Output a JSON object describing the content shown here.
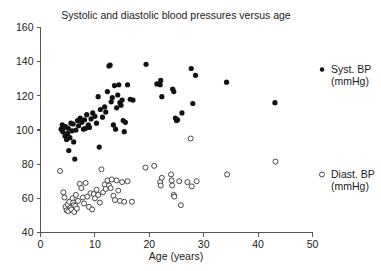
{
  "chart_data": {
    "type": "scatter",
    "title": "Systolic and diastolic blood pressures versus age",
    "xlabel": "Age (years)",
    "ylabel": "",
    "xlim": [
      0,
      50
    ],
    "ylim": [
      40,
      160
    ],
    "xticks": [
      0,
      10,
      20,
      30,
      40,
      50
    ],
    "yticks": [
      40,
      60,
      80,
      100,
      120,
      140,
      160
    ],
    "xtick_labels": [
      "0",
      "10",
      "20",
      "30",
      "40",
      "50"
    ],
    "ytick_labels": [
      "40",
      "60",
      "80",
      "100",
      "120",
      "140",
      "160"
    ],
    "grid": false,
    "legend_position": "right",
    "series": [
      {
        "name": "Syst. BP",
        "unit": "(mmHg)",
        "marker": "filled-circle",
        "color": "#111111",
        "points": [
          [
            3.8,
            100.5
          ],
          [
            4.0,
            103.0
          ],
          [
            4.1,
            99.0
          ],
          [
            4.3,
            101.5
          ],
          [
            4.5,
            96.5
          ],
          [
            4.6,
            102.0
          ],
          [
            4.8,
            94.5
          ],
          [
            5.0,
            98.0
          ],
          [
            5.1,
            101.0
          ],
          [
            5.2,
            88.0
          ],
          [
            5.4,
            95.5
          ],
          [
            5.6,
            104.0
          ],
          [
            5.8,
            99.5
          ],
          [
            6.0,
            103.5
          ],
          [
            6.1,
            93.0
          ],
          [
            6.3,
            83.0
          ],
          [
            6.5,
            100.0
          ],
          [
            6.8,
            105.5
          ],
          [
            7.0,
            102.5
          ],
          [
            7.3,
            107.0
          ],
          [
            7.6,
            104.5
          ],
          [
            7.9,
            100.5
          ],
          [
            8.1,
            106.0
          ],
          [
            8.3,
            101.0
          ],
          [
            8.5,
            109.0
          ],
          [
            8.8,
            103.0
          ],
          [
            9.0,
            101.5
          ],
          [
            9.3,
            106.5
          ],
          [
            9.6,
            110.0
          ],
          [
            10.0,
            108.0
          ],
          [
            10.3,
            104.0
          ],
          [
            10.6,
            119.5
          ],
          [
            10.8,
            90.0
          ],
          [
            11.0,
            112.0
          ],
          [
            11.4,
            107.5
          ],
          [
            11.8,
            113.5
          ],
          [
            12.0,
            110.5
          ],
          [
            12.3,
            122.5
          ],
          [
            12.6,
            137.5
          ],
          [
            12.8,
            138.0
          ],
          [
            13.0,
            116.5
          ],
          [
            13.2,
            119.0
          ],
          [
            13.4,
            103.0
          ],
          [
            13.6,
            126.0
          ],
          [
            13.8,
            100.5
          ],
          [
            14.0,
            113.0
          ],
          [
            14.2,
            120.5
          ],
          [
            14.4,
            126.5
          ],
          [
            14.6,
            116.0
          ],
          [
            14.8,
            114.5
          ],
          [
            15.0,
            117.5
          ],
          [
            15.2,
            105.5
          ],
          [
            15.4,
            99.0
          ],
          [
            15.6,
            104.5
          ],
          [
            16.0,
            126.5
          ],
          [
            16.5,
            118.0
          ],
          [
            17.0,
            117.5
          ],
          [
            19.4,
            138.5
          ],
          [
            21.4,
            127.0
          ],
          [
            22.0,
            126.5
          ],
          [
            22.1,
            129.0
          ],
          [
            22.3,
            119.5
          ],
          [
            24.3,
            124.0
          ],
          [
            24.5,
            122.5
          ],
          [
            24.8,
            107.0
          ],
          [
            25.0,
            105.5
          ],
          [
            25.2,
            106.0
          ],
          [
            26.0,
            110.0
          ],
          [
            27.7,
            136.0
          ],
          [
            28.0,
            115.5
          ],
          [
            28.5,
            132.0
          ],
          [
            34.2,
            128.0
          ],
          [
            43.1,
            116.0
          ]
        ]
      },
      {
        "name": "Diast. BP",
        "unit": "(mmHg)",
        "marker": "open-circle",
        "color": "#333333",
        "points": [
          [
            3.6,
            76.0
          ],
          [
            4.2,
            63.5
          ],
          [
            4.4,
            60.5
          ],
          [
            4.6,
            55.0
          ],
          [
            4.8,
            53.0
          ],
          [
            5.0,
            56.5
          ],
          [
            5.1,
            52.5
          ],
          [
            5.3,
            58.0
          ],
          [
            5.5,
            54.5
          ],
          [
            5.7,
            53.5
          ],
          [
            5.9,
            60.0
          ],
          [
            6.0,
            57.5
          ],
          [
            6.1,
            56.0
          ],
          [
            6.2,
            52.0
          ],
          [
            6.4,
            55.5
          ],
          [
            6.5,
            62.0
          ],
          [
            6.7,
            54.0
          ],
          [
            6.9,
            58.5
          ],
          [
            7.2,
            68.5
          ],
          [
            7.5,
            66.0
          ],
          [
            7.8,
            60.5
          ],
          [
            8.0,
            57.0
          ],
          [
            8.3,
            69.0
          ],
          [
            8.6,
            61.0
          ],
          [
            8.9,
            55.0
          ],
          [
            9.2,
            63.0
          ],
          [
            9.5,
            53.5
          ],
          [
            9.8,
            62.5
          ],
          [
            10.0,
            60.0
          ],
          [
            10.3,
            65.0
          ],
          [
            10.6,
            62.0
          ],
          [
            10.9,
            57.5
          ],
          [
            11.2,
            77.0
          ],
          [
            11.5,
            63.5
          ],
          [
            11.8,
            68.0
          ],
          [
            12.0,
            65.5
          ],
          [
            12.3,
            70.5
          ],
          [
            12.6,
            67.5
          ],
          [
            12.9,
            66.0
          ],
          [
            13.1,
            71.0
          ],
          [
            13.4,
            61.5
          ],
          [
            13.7,
            59.0
          ],
          [
            14.0,
            70.5
          ],
          [
            14.3,
            64.5
          ],
          [
            14.6,
            58.5
          ],
          [
            15.0,
            69.5
          ],
          [
            15.4,
            58.0
          ],
          [
            16.0,
            70.0
          ],
          [
            16.8,
            58.0
          ],
          [
            19.3,
            78.0
          ],
          [
            20.9,
            79.0
          ],
          [
            22.0,
            69.5
          ],
          [
            22.1,
            67.5
          ],
          [
            22.3,
            72.0
          ],
          [
            24.0,
            74.0
          ],
          [
            24.1,
            70.5
          ],
          [
            24.2,
            67.5
          ],
          [
            24.5,
            62.0
          ],
          [
            24.6,
            61.0
          ],
          [
            25.5,
            70.0
          ],
          [
            25.8,
            56.0
          ],
          [
            27.0,
            69.5
          ],
          [
            27.6,
            95.0
          ],
          [
            27.8,
            67.0
          ],
          [
            28.7,
            70.0
          ],
          [
            34.3,
            74.0
          ],
          [
            43.2,
            81.5
          ]
        ]
      }
    ]
  },
  "legend": {
    "items": [
      {
        "label": "Syst. BP",
        "sub": "(mmHg)",
        "marker": "filled-circle"
      },
      {
        "label": "Diast. BP",
        "sub": "(mmHg)",
        "marker": "open-circle"
      }
    ]
  }
}
